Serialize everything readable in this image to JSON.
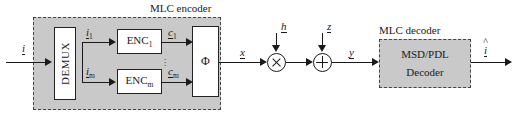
{
  "figure": {
    "type": "block-diagram"
  },
  "groups": {
    "encoder": {
      "caption": "MLC encoder"
    },
    "decoder": {
      "caption": "MLC decoder"
    }
  },
  "blocks": {
    "demux": {
      "label": "DEMUX"
    },
    "enc_first": {
      "label": "ENC",
      "sub": "1"
    },
    "enc_last": {
      "label": "ENC",
      "sub": "m"
    },
    "mapper": {
      "label": "Φ"
    },
    "decoder": {
      "line1": "MSD/PDL",
      "line2": "Decoder"
    }
  },
  "operators": {
    "multiply": {
      "glyph": "×",
      "name": "multiplier"
    },
    "add": {
      "glyph": "+",
      "name": "adder"
    }
  },
  "signals": {
    "input": {
      "label": "i"
    },
    "branch_first": {
      "label": "i",
      "sub": "1"
    },
    "branch_last": {
      "label": "i",
      "sub": "m"
    },
    "code_first": {
      "label": "c",
      "sub": "1"
    },
    "code_last": {
      "label": "c",
      "sub": "m"
    },
    "channel_symbol": {
      "label": "x"
    },
    "channel_gain": {
      "label": "h"
    },
    "noise": {
      "label": "z"
    },
    "received": {
      "label": "y"
    },
    "estimate": {
      "label": "i"
    }
  },
  "ellipsis": {
    "glyph": "⋮"
  },
  "colors": {
    "group_fill": "#c9c9c9",
    "block_fill": "#ffffff",
    "line": "#1a1a1a",
    "dash_border": "#444444",
    "page_background": "#ffffff"
  }
}
